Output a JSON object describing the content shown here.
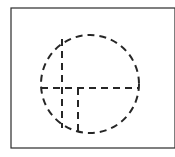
{
  "figure": {
    "title": "Dashed circle with centerlines",
    "canvas": {
      "width": 175,
      "height": 157,
      "background_color": "#ffffff"
    },
    "frame": {
      "label": "Figure border rectangle",
      "x": 11,
      "y": 8,
      "width": 164,
      "height": 140,
      "stroke_color": "#2b2b2b",
      "stroke_width": 1.2,
      "fill": "none",
      "right_edge_clipped": true
    },
    "circle": {
      "label": "Dashed construction circle",
      "center_x": 90,
      "center_y": 84,
      "radius": 49,
      "stroke_color": "#262626",
      "stroke_width": 2,
      "dash_pattern": "7 5",
      "fill": "none"
    },
    "centerlines": [
      {
        "name": "horizontal-centerline",
        "orientation": "horizontal",
        "x1": 41,
        "y1": 88,
        "x2": 139,
        "y2": 88,
        "stroke_color": "#262626",
        "stroke_width": 2,
        "dash_pattern": "7 5"
      },
      {
        "name": "vertical-centerline-left",
        "orientation": "vertical",
        "x1": 62,
        "y1": 39,
        "x2": 62,
        "y2": 128,
        "stroke_color": "#262626",
        "stroke_width": 2,
        "dash_pattern": "7 5"
      },
      {
        "name": "vertical-centerline-right",
        "orientation": "vertical",
        "x1": 78,
        "y1": 88,
        "x2": 78,
        "y2": 136,
        "stroke_color": "#262626",
        "stroke_width": 2,
        "dash_pattern": "7 5"
      }
    ],
    "intersections": [
      {
        "name": "cross-junction",
        "glyph": "plus",
        "x": 62,
        "y": 88
      },
      {
        "name": "tee-junction",
        "glyph": "tee",
        "x": 78,
        "y": 88
      }
    ]
  }
}
